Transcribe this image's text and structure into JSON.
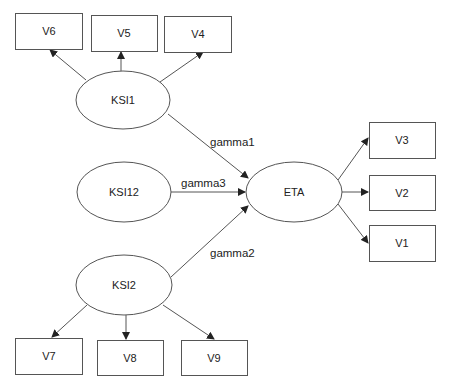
{
  "diagram": {
    "type": "structural-equation-path-diagram",
    "latent": {
      "ksi1": {
        "label": "KSI1"
      },
      "ksi12": {
        "label": "KSI12"
      },
      "ksi2": {
        "label": "KSI2"
      },
      "eta": {
        "label": "ETA"
      }
    },
    "observed": {
      "v1": {
        "label": "V1"
      },
      "v2": {
        "label": "V2"
      },
      "v3": {
        "label": "V3"
      },
      "v4": {
        "label": "V4"
      },
      "v5": {
        "label": "V5"
      },
      "v6": {
        "label": "V6"
      },
      "v7": {
        "label": "V7"
      },
      "v8": {
        "label": "V8"
      },
      "v9": {
        "label": "V9"
      }
    },
    "paths": {
      "gamma1": {
        "label": "gamma1",
        "from": "KSI1",
        "to": "ETA"
      },
      "gamma2": {
        "label": "gamma2",
        "from": "KSI2",
        "to": "ETA"
      },
      "gamma3": {
        "label": "gamma3",
        "from": "KSI12",
        "to": "ETA"
      }
    },
    "colors": {
      "stroke": "#555555",
      "text": "#222222",
      "background": "#ffffff"
    }
  }
}
